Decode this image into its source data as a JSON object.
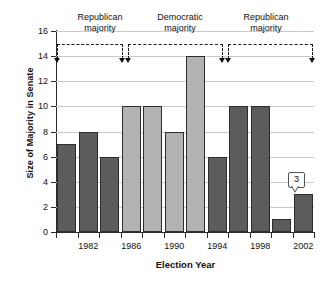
{
  "chart_data": {
    "type": "bar",
    "title": "",
    "xlabel": "Election Year",
    "ylabel": "Size of Majority in Senate",
    "categories": [
      "1980",
      "1982",
      "1984",
      "1986",
      "1988",
      "1990",
      "1992",
      "1994",
      "1996",
      "1998",
      "2000",
      "2002"
    ],
    "values": [
      7,
      8,
      6,
      10,
      10,
      8,
      14,
      6,
      10,
      10,
      1,
      3
    ],
    "series": [
      {
        "name": "Size of Majority in Senate",
        "values": [
          7,
          8,
          6,
          10,
          10,
          8,
          14,
          6,
          10,
          10,
          1,
          3
        ],
        "party": [
          "Republican",
          "Republican",
          "Republican",
          "Democratic",
          "Democratic",
          "Democratic",
          "Democratic",
          "Republican",
          "Republican",
          "Republican",
          "Republican",
          "Republican"
        ]
      }
    ],
    "ylim": [
      0,
      16
    ],
    "ytick_values": [
      0,
      2,
      4,
      6,
      8,
      10,
      12,
      14,
      16
    ],
    "ytick_labels": [
      "0",
      "2",
      "4",
      "6",
      "8",
      "10",
      "12",
      "14",
      "16"
    ],
    "xtick_labels": [
      "1982",
      "1986",
      "1990",
      "1994",
      "1998",
      "2002"
    ],
    "grid": "horizontal",
    "legend": "none",
    "colors": {
      "republican_bar": "#5c5c5c",
      "democratic_bar": "#b2b2b2",
      "bar_outline": "#2d2d2d",
      "gridline": "#c9c9c9",
      "axis": "#2b2b2b",
      "annotation": "#1a1a1a"
    },
    "annotations": [
      {
        "name": "republican-majority-1",
        "label_line1": "Republican",
        "label_line2": "majority"
      },
      {
        "name": "democratic-majority",
        "label_line1": "Democratic",
        "label_line2": "majority"
      },
      {
        "name": "republican-majority-2",
        "label_line1": "Republican",
        "label_line2": "majority"
      },
      {
        "name": "value-callout",
        "text": "3",
        "points_to": "2002"
      }
    ]
  },
  "axes": {
    "y_labels": [
      "16",
      "14",
      "12",
      "10",
      "8",
      "6",
      "4",
      "2",
      "0"
    ],
    "x_labels": [
      "1982",
      "1986",
      "1990",
      "1994",
      "1998",
      "2002"
    ],
    "x_title": "Election Year",
    "y_title": "Size of Majority in Senate"
  },
  "periods": {
    "rep1": {
      "line1": "Republican",
      "line2": "majority"
    },
    "dem": {
      "line1": "Democratic",
      "line2": "majority"
    },
    "rep2": {
      "line1": "Republican",
      "line2": "majority"
    }
  },
  "callout": {
    "value": "3"
  }
}
